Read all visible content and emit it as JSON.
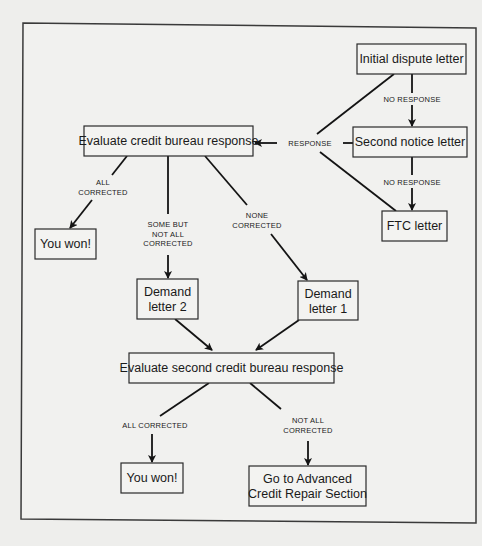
{
  "diagram": {
    "nodes": {
      "initial_dispute": {
        "label": "Initial dispute letter"
      },
      "second_notice": {
        "label": "Second notice letter"
      },
      "ftc_letter": {
        "label": "FTC letter"
      },
      "evaluate_response": {
        "label": "Evaluate credit bureau response"
      },
      "you_won_1": {
        "label": "You won!"
      },
      "demand_letter_2": {
        "lines": [
          "Demand",
          "letter 2"
        ]
      },
      "demand_letter_1": {
        "lines": [
          "Demand",
          "letter 1"
        ]
      },
      "evaluate_second": {
        "label": "Evaluate second credit bureau response"
      },
      "you_won_2": {
        "label": "You won!"
      },
      "advanced_repair": {
        "lines": [
          "Go to Advanced",
          "Credit Repair Section"
        ]
      }
    },
    "edge_labels": {
      "no_response_1": "NO RESPONSE",
      "no_response_2": "NO RESPONSE",
      "response": "RESPONSE",
      "all_corrected_1": [
        "ALL",
        "CORRECTED"
      ],
      "some_but_not_all": [
        "SOME BUT",
        "NOT ALL",
        "CORRECTED"
      ],
      "none_corrected": [
        "NONE",
        "CORRECTED"
      ],
      "all_corrected_2": "ALL CORRECTED",
      "not_all_corrected": [
        "NOT ALL",
        "CORRECTED"
      ]
    }
  }
}
